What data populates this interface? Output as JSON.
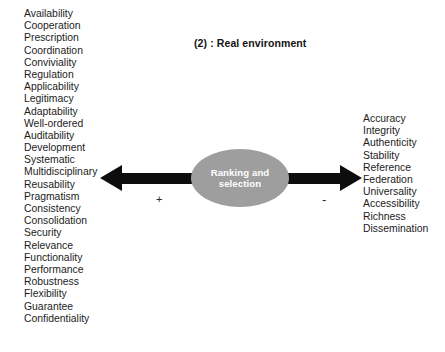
{
  "figure": {
    "title": "(2) : Real environment",
    "center_node": {
      "line1": "Ranking and",
      "line2": "selection",
      "fill_color": "#9e9e9e",
      "text_color": "#ffffff"
    },
    "signs": {
      "left": "+",
      "right": "-"
    },
    "arrows": {
      "left": {
        "name": "arrow-pointing-left",
        "direction": "left",
        "color": "#0d0d0d"
      },
      "right": {
        "name": "arrow-pointing-right",
        "direction": "right",
        "color": "#0d0d0d"
      }
    },
    "left_list": [
      "Availability",
      "Cooperation",
      "Prescription",
      "Coordination",
      "Conviviality",
      "Regulation",
      "Applicability",
      "Legitimacy",
      "Adaptability",
      "Well-ordered",
      "Auditability",
      "Development",
      "Systematic",
      "Multidisciplinary",
      "Reusability",
      "Pragmatism",
      "Consistency",
      "Consolidation",
      "Security",
      "Relevance",
      "Functionality",
      "Performance",
      "Robustness",
      "Flexibility",
      "Guarantee",
      "Confidentiality"
    ],
    "right_list": [
      "Accuracy",
      "Integrity",
      "Authenticity",
      "Stability",
      "Reference",
      "Federation",
      "Universality",
      "Accessibility",
      "Richness",
      "Dissemination"
    ]
  }
}
